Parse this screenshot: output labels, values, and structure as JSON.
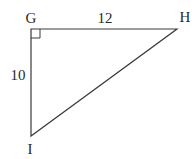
{
  "diagram": {
    "type": "right-triangle",
    "vertices": {
      "G": {
        "label": "G",
        "x": 31,
        "y": 29
      },
      "H": {
        "label": "H",
        "x": 177,
        "y": 29
      },
      "I": {
        "label": "I",
        "x": 31,
        "y": 136
      }
    },
    "right_angle_at": "G",
    "sides": {
      "GH": {
        "label": "12"
      },
      "GI": {
        "label": "10"
      },
      "HI": {
        "label": ""
      }
    },
    "colors": {
      "stroke": "#3a3a3a",
      "text": "#2a2a2a",
      "background": "#ffffff"
    }
  }
}
